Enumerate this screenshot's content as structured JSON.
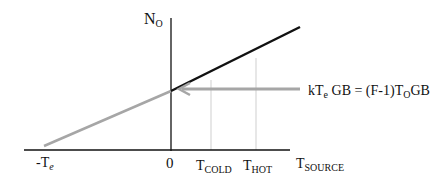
{
  "diagram": {
    "y_axis_label": {
      "main": "N",
      "sub": "O"
    },
    "x_axis_label": {
      "main": "T",
      "sub": "SOURCE"
    },
    "ticks": [
      {
        "main": "-T",
        "sub": "e"
      },
      {
        "main": "0",
        "sub": ""
      },
      {
        "main": "T",
        "sub": "COLD"
      },
      {
        "main": "T",
        "sub": "HOT"
      }
    ],
    "annotation": {
      "lhs_pre": "kT",
      "lhs_sub": "e",
      "lhs_post": " GB = (F-1)T",
      "rhs_sub": "O",
      "rhs_post": "GB"
    },
    "colors": {
      "line_black": "#111111",
      "line_gray": "#a6a6a6",
      "guide": "#cccccc"
    }
  }
}
